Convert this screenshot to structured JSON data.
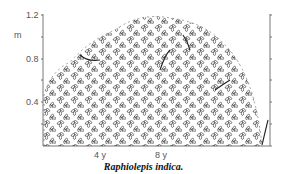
{
  "figure": {
    "y_unit": "m",
    "y_ticks": [
      "1.2",
      "0.8",
      "0.4"
    ],
    "x_ticks": [
      "4 y",
      "8 y"
    ],
    "caption": "Raphiolepis indica."
  }
}
